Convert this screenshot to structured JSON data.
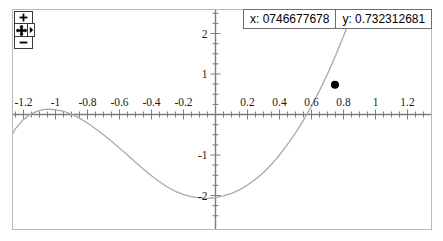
{
  "readout": {
    "x_label": "x: 0746677678",
    "y_label": "y: 0.732312681"
  },
  "nav": {
    "zoom_in_label": "+",
    "zoom_out_label": "−",
    "pan_name": "pan",
    "expand_name": "expand"
  },
  "chart_data": {
    "type": "line",
    "title": "",
    "xlabel": "",
    "ylabel": "",
    "xlim": [
      -1.3,
      1.3
    ],
    "ylim": [
      -2.45,
      2.45
    ],
    "grid": false,
    "legend": null,
    "axis_origin": {
      "x": 0,
      "y": 0
    },
    "x_ticks_left": [
      "-1.2",
      "-1",
      "-0.8",
      "-0.6",
      "-0.4",
      "-0.2"
    ],
    "x_tick_values_left": [
      -1.2,
      -1.0,
      -0.8,
      -0.6,
      -0.4,
      -0.2
    ],
    "x_ticks_right": [
      "0.2",
      "0.4",
      "0.6",
      "0.8",
      "1",
      "1.2"
    ],
    "x_tick_values_right": [
      0.2,
      0.4,
      0.6,
      0.8,
      1.0,
      1.2
    ],
    "y_ticks": [
      "2",
      "1",
      "-1",
      "-2"
    ],
    "y_tick_values": [
      2,
      1,
      -1,
      -2
    ],
    "minor_tick_step": 0.05,
    "major_tick_step": 0.2,
    "y_minor_tick_step": 0.25,
    "series": [
      {
        "name": "curve",
        "color": "#a9a9a9",
        "x": [
          -1.3,
          -1.25,
          -1.2,
          -1.15,
          -1.1,
          -1.05,
          -1.0,
          -0.95,
          -0.9,
          -0.85,
          -0.8,
          -0.75,
          -0.7,
          -0.65,
          -0.6,
          -0.55,
          -0.5,
          -0.45,
          -0.4,
          -0.35,
          -0.3,
          -0.25,
          -0.2,
          -0.15,
          -0.1,
          -0.05,
          0.0,
          0.05,
          0.1,
          0.15,
          0.2,
          0.25,
          0.3,
          0.35,
          0.4,
          0.45,
          0.5,
          0.55,
          0.6,
          0.65,
          0.7,
          0.75,
          0.8,
          0.85,
          0.9
        ],
        "y": [
          -0.7,
          -0.35,
          -0.12,
          0.02,
          0.1,
          0.13,
          0.12,
          0.08,
          0.01,
          -0.09,
          -0.21,
          -0.35,
          -0.5,
          -0.66,
          -0.83,
          -1.0,
          -1.18,
          -1.35,
          -1.51,
          -1.66,
          -1.79,
          -1.9,
          -1.98,
          -2.03,
          -2.06,
          -2.07,
          -2.05,
          -2.01,
          -1.95,
          -1.86,
          -1.74,
          -1.6,
          -1.43,
          -1.23,
          -1.0,
          -0.74,
          -0.46,
          -0.14,
          0.21,
          0.59,
          1.0,
          1.45,
          1.93,
          2.45,
          2.45
        ]
      }
    ],
    "points": [
      {
        "name": "cursor-point",
        "x": 0.746677678,
        "y": 0.732312681,
        "color": "#000000",
        "radius": 4
      }
    ]
  }
}
